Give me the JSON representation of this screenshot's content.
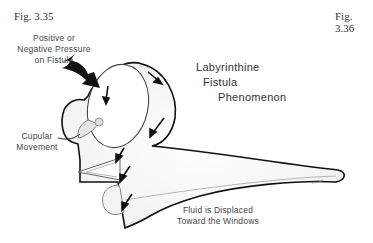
{
  "figures": {
    "left_label": "Fig. 3.35",
    "right_label": "Fig. 3.36"
  },
  "diagram": {
    "title_lines": [
      "Labyrinthine",
      "Fistula",
      "Phenomenon"
    ],
    "labels": {
      "pressure": [
        "Positive or",
        "Negative Pressure",
        "on Fistula"
      ],
      "cupular": [
        "Cupular",
        "Movement"
      ],
      "fluid": [
        "Fluid is Displaced",
        "Toward the Windows"
      ]
    },
    "signature": "Hl.Gor"
  }
}
